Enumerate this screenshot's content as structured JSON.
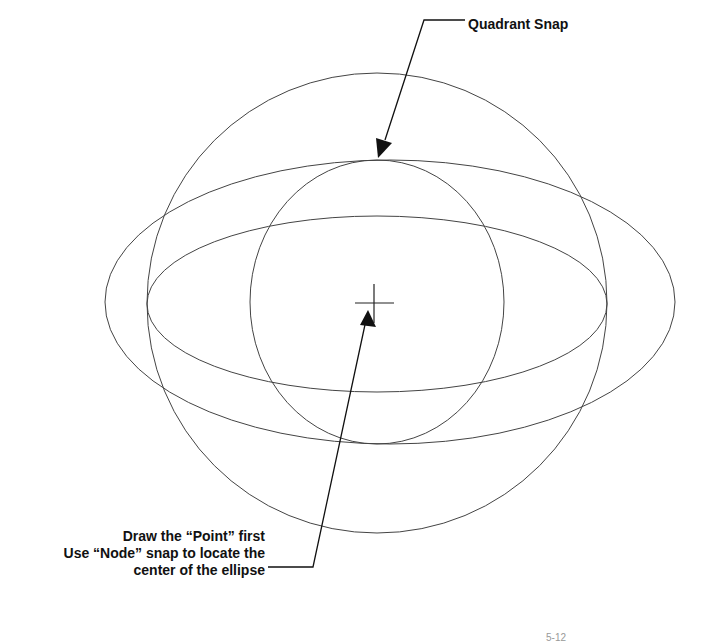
{
  "annotations": {
    "quadrant_snap": "Quadrant Snap",
    "node_lines": [
      "Draw the “Point” first",
      "Use “Node” snap to locate the",
      "center of the ellipse"
    ]
  },
  "footer": {
    "page_fragment": "5-12"
  }
}
